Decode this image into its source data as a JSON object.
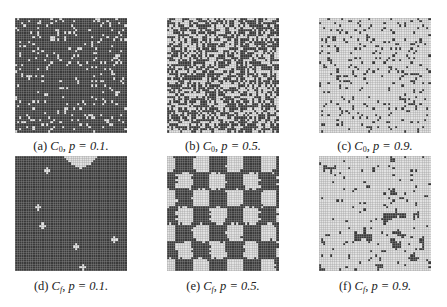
{
  "figure": {
    "panels": [
      {
        "id": "a",
        "label": "(a)",
        "config": "C",
        "config_sub": "0",
        "p_text": "p = 0.1.",
        "p": 0.1,
        "state": "initial"
      },
      {
        "id": "b",
        "label": "(b)",
        "config": "C",
        "config_sub": "0",
        "p_text": "p = 0.5.",
        "p": 0.5,
        "state": "initial"
      },
      {
        "id": "c",
        "label": "(c)",
        "config": "C",
        "config_sub": "0",
        "p_text": "p = 0.9.",
        "p": 0.9,
        "state": "initial"
      },
      {
        "id": "d",
        "label": "(d)",
        "config": "C",
        "config_sub": "f",
        "p_text": "p = 0.1.",
        "p": 0.1,
        "state": "final"
      },
      {
        "id": "e",
        "label": "(e)",
        "config": "C",
        "config_sub": "f",
        "p_text": "p = 0.5.",
        "p": 0.5,
        "state": "final"
      },
      {
        "id": "f",
        "label": "(f)",
        "config": "C",
        "config_sub": "f",
        "p_text": "p = 0.9.",
        "p": 0.9,
        "state": "final"
      }
    ],
    "grid_cells": 50,
    "colors": {
      "dark_cell": "#3a3a3a",
      "light_cell": "#e2e2e2",
      "grid_line_dark": "#4a4a4a",
      "grid_line_light": "#9a9a9a"
    }
  }
}
